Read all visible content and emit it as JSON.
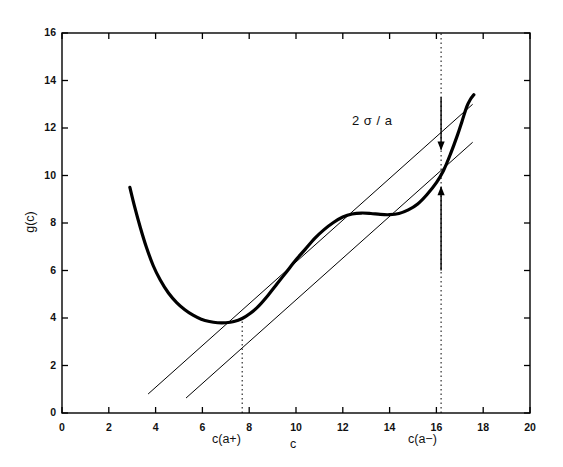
{
  "chart_data": {
    "type": "line",
    "title": "",
    "xlabel": "c",
    "ylabel": "g(c)",
    "xlim": [
      0,
      20
    ],
    "ylim": [
      0,
      16
    ],
    "xticks": [
      0,
      2,
      4,
      6,
      8,
      10,
      12,
      14,
      16,
      18,
      20
    ],
    "xtick_labels": [
      "0",
      "2",
      "4",
      "6",
      "8",
      "10",
      "12",
      "14",
      "16",
      "18",
      "20"
    ],
    "yticks": [
      0,
      2,
      4,
      6,
      8,
      10,
      12,
      14,
      16
    ],
    "ytick_labels": [
      "0",
      "2",
      "4",
      "6",
      "8",
      "10",
      "12",
      "14",
      "16"
    ],
    "grid": false,
    "legend": null,
    "series": [
      {
        "name": "g(c)",
        "style": "thick-solid-curve",
        "linewidth": 3.2,
        "color": "#000000",
        "x": [
          2.9,
          3.1,
          3.35,
          3.6,
          3.9,
          4.2,
          4.55,
          4.9,
          5.25,
          5.6,
          5.95,
          6.3,
          6.65,
          7.0,
          7.35,
          7.7,
          8.05,
          8.4,
          8.8,
          9.2,
          9.6,
          10.0,
          10.4,
          10.8,
          11.2,
          11.6,
          12.0,
          12.4,
          12.8,
          13.2,
          13.6,
          14.0,
          14.4,
          14.8,
          15.2,
          15.6,
          16.0,
          16.3,
          16.6,
          16.9,
          17.1,
          17.3,
          17.45,
          17.6
        ],
        "y": [
          9.5,
          8.7,
          7.8,
          7.0,
          6.2,
          5.6,
          5.05,
          4.65,
          4.35,
          4.12,
          3.95,
          3.85,
          3.8,
          3.8,
          3.85,
          3.98,
          4.2,
          4.5,
          4.95,
          5.45,
          5.95,
          6.45,
          6.9,
          7.35,
          7.72,
          8.02,
          8.25,
          8.38,
          8.42,
          8.4,
          8.36,
          8.35,
          8.4,
          8.55,
          8.8,
          9.2,
          9.7,
          10.2,
          10.9,
          11.7,
          12.3,
          12.9,
          13.2,
          13.4
        ]
      },
      {
        "name": "upper-tangent-line",
        "style": "thin-solid-line",
        "linewidth": 1,
        "color": "#000000",
        "x": [
          3.68,
          17.55
        ],
        "y": [
          0.8,
          13.0
        ]
      },
      {
        "name": "lower-tangent-line",
        "style": "thin-solid-line",
        "linewidth": 1,
        "color": "#000000",
        "x": [
          5.3,
          17.55
        ],
        "y": [
          0.63,
          11.4
        ]
      }
    ],
    "dotted_verticals": [
      {
        "name": "c(a+)",
        "x": 7.7,
        "y_top": 3.95,
        "y_bottom": 0.0
      },
      {
        "name": "c(a-)",
        "x": 16.2,
        "y_top": 16.0,
        "y_bottom": 0.0
      }
    ],
    "annotations": [
      {
        "name": "gap-label",
        "text": "2 σ / a",
        "x": 12.6,
        "y": 11.6
      },
      {
        "name": "down-arrow",
        "x": 16.2,
        "y_from": 13.3,
        "y_to": 11.05
      },
      {
        "name": "up-arrow",
        "x": 16.2,
        "y_from": 6.0,
        "y_to": 9.55
      }
    ],
    "x_axis_markers": [
      {
        "name": "c(a+)",
        "label": "c(a+)",
        "x": 7.7
      },
      {
        "name": "c(a-)",
        "label": "c(a−)",
        "x": 16.2
      }
    ]
  },
  "axes": {
    "xlabel": "c",
    "ylabel": "g(c)"
  },
  "labels": {
    "gap": "2 σ / a",
    "c_a_plus": "c(a+)",
    "c_a_minus": "c(a−)"
  },
  "xticks": [
    "0",
    "2",
    "4",
    "6",
    "8",
    "10",
    "12",
    "14",
    "16",
    "18",
    "20"
  ],
  "yticks": [
    "0",
    "2",
    "4",
    "6",
    "8",
    "10",
    "12",
    "14",
    "16"
  ]
}
